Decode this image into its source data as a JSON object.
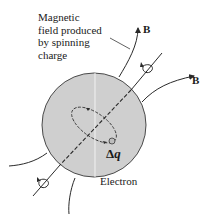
{
  "diagram": {
    "caption_lines": [
      "Magnetic",
      "field produced",
      "by spinning",
      "charge"
    ],
    "field_label_1": "B",
    "field_label_2": "B",
    "charge_label_delta": "Δ",
    "charge_label_var": "q",
    "object_label": "Electron",
    "colors": {
      "sphere_fill": "#cfcfcf",
      "sphere_stroke": "#4a4a4a",
      "line": "#2a2a2a",
      "highlight": "#f2f2f2"
    },
    "sphere": {
      "cx": 94,
      "cy": 125,
      "r": 52
    },
    "elements": [
      "spin-axis",
      "rotation-arrow-top",
      "rotation-arrow-bottom",
      "charge-orbit",
      "field-line-top",
      "field-line-right",
      "field-line-left",
      "field-line-bottom",
      "leader-line"
    ]
  }
}
